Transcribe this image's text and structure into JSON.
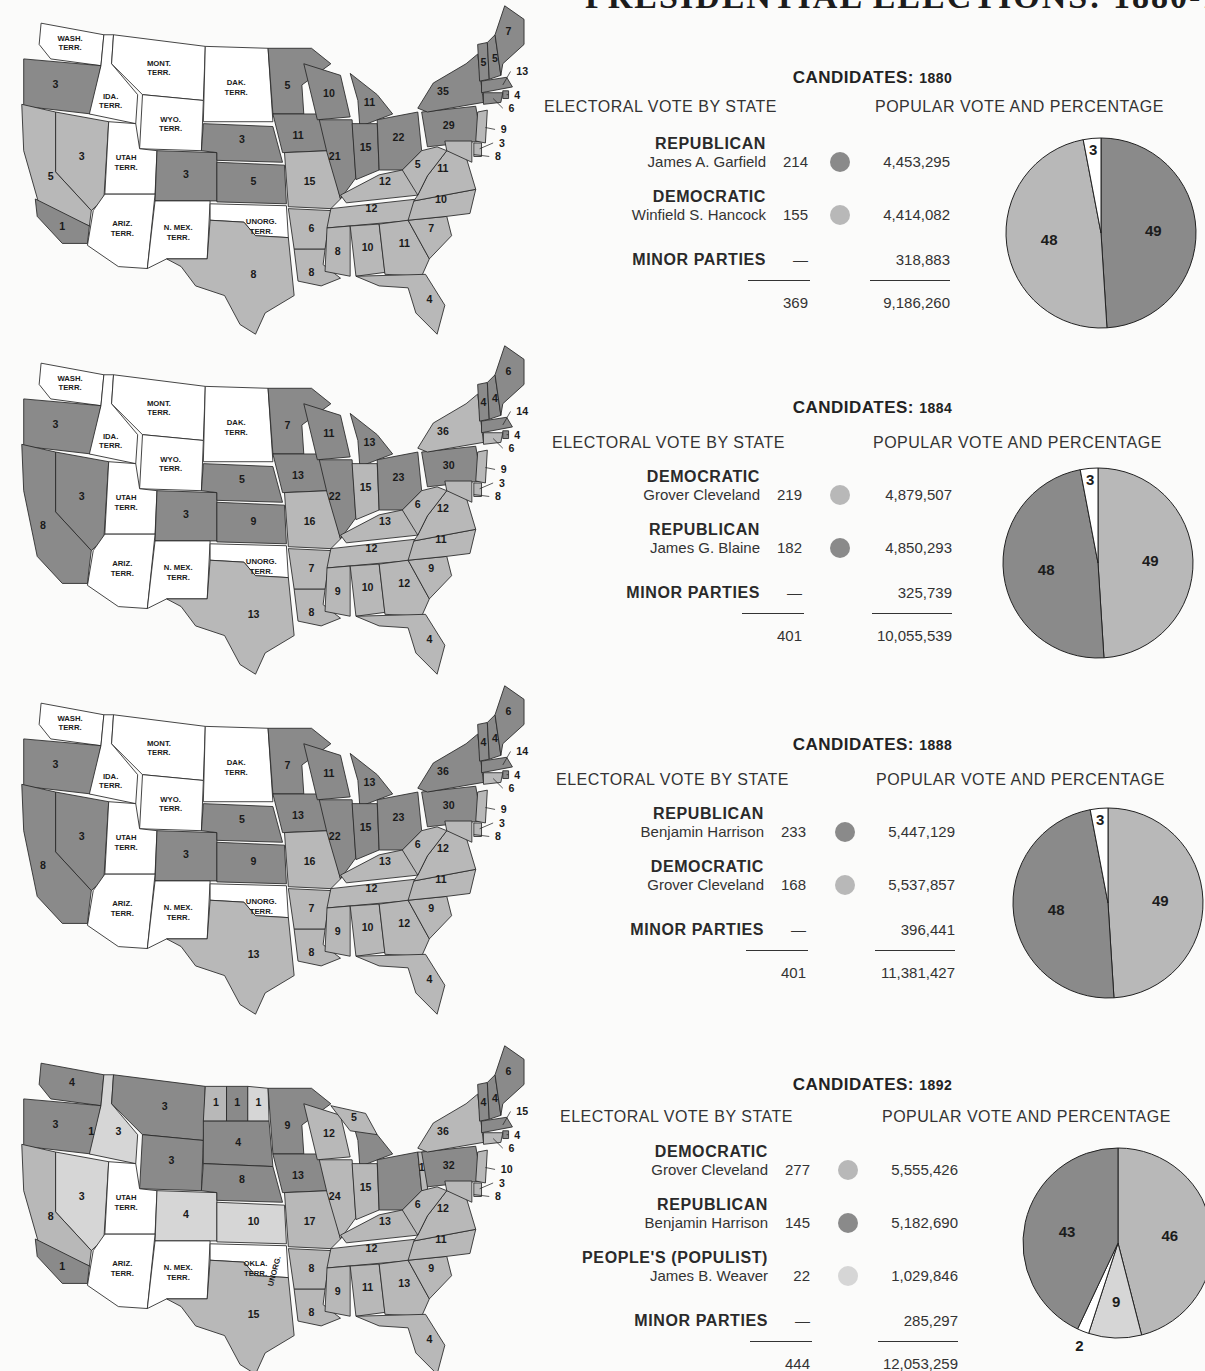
{
  "page": {
    "title": "PRESIDENTIAL ELECTIONS: 1880-1892"
  },
  "colors": {
    "republican": "#8a8a8a",
    "democratic": "#b8b8b8",
    "populist": "#d6d6d6",
    "minor": "#ffffff",
    "territory": "#ffffff",
    "outline": "#2a2a2a"
  },
  "common": {
    "electoral_heading": "ELECTORAL VOTE BY STATE",
    "popular_heading": "POPULAR VOTE AND PERCENTAGE",
    "candidates_label": "CANDIDATES:",
    "dash": "—"
  },
  "elections": [
    {
      "year": "1880",
      "rows": [
        {
          "party": "REPUBLICAN",
          "candidate": "James A. Garfield",
          "electoral": "214",
          "popular": "4,453,295",
          "color": "#8a8a8a"
        },
        {
          "party": "DEMOCRATIC",
          "candidate": "Winfield S. Hancock",
          "electoral": "155",
          "popular": "4,414,082",
          "color": "#b8b8b8"
        },
        {
          "party": "MINOR PARTIES",
          "candidate": "",
          "electoral": "—",
          "popular": "318,883",
          "color": ""
        }
      ],
      "total_electoral": "369",
      "total_popular": "9,186,260",
      "map_labels": {
        "territories": [
          "WASH. TERR.",
          "MONT. TERR.",
          "DAK. TERR.",
          "IDA. TERR.",
          "WYO. TERR.",
          "UTAH TERR.",
          "ARIZ. TERR.",
          "N. MEX. TERR.",
          "UNORG. TERR."
        ],
        "states": {
          "OR": "3",
          "NV": "3",
          "CA_N": "5",
          "CA_S": "1",
          "CO": "3",
          "NE": "3",
          "KS": "5",
          "TX": "8",
          "MN": "5",
          "IA": "11",
          "WI": "10",
          "MI": "11",
          "IL": "21",
          "IN": "15",
          "OH": "22",
          "PA": "29",
          "NY": "35",
          "VT": "5",
          "NH": "5",
          "ME": "7",
          "MA": "13",
          "RI": "4",
          "CT": "6",
          "NJ": "9",
          "DE": "3",
          "MD": "8",
          "MO": "15",
          "KY": "12",
          "WV": "5",
          "VA": "11",
          "TN": "12",
          "NC": "10",
          "SC": "7",
          "AR": "6",
          "LA": "8",
          "MS": "8",
          "AL": "10",
          "GA": "11",
          "FL": "4"
        }
      }
    },
    {
      "year": "1884",
      "rows": [
        {
          "party": "DEMOCRATIC",
          "candidate": "Grover Cleveland",
          "electoral": "219",
          "popular": "4,879,507",
          "color": "#b8b8b8"
        },
        {
          "party": "REPUBLICAN",
          "candidate": "James G. Blaine",
          "electoral": "182",
          "popular": "4,850,293",
          "color": "#8a8a8a"
        },
        {
          "party": "MINOR PARTIES",
          "candidate": "",
          "electoral": "—",
          "popular": "325,739",
          "color": ""
        }
      ],
      "total_electoral": "401",
      "total_popular": "10,055,539",
      "map_labels": {
        "territories": [
          "WASH. TERR.",
          "MONT. TERR.",
          "DAK. TERR.",
          "IDA. TERR.",
          "WYO. TERR.",
          "UTAH TERR.",
          "ARIZ. TERR.",
          "N. MEX. TERR.",
          "UNORG. TERR."
        ],
        "states": {
          "OR": "3",
          "NV": "3",
          "CA": "8",
          "CO": "3",
          "NE": "5",
          "KS": "9",
          "TX": "13",
          "MN": "7",
          "IA": "13",
          "WI": "11",
          "MI": "13",
          "IL": "22",
          "IN": "15",
          "OH": "23",
          "PA": "30",
          "NY": "36",
          "VT": "4",
          "NH": "4",
          "ME": "6",
          "MA": "14",
          "RI": "4",
          "CT": "6",
          "NJ": "9",
          "DE": "3",
          "MD": "8",
          "MO": "16",
          "KY": "13",
          "WV": "6",
          "VA": "12",
          "TN": "12",
          "NC": "11",
          "SC": "9",
          "AR": "7",
          "LA": "8",
          "MS": "9",
          "AL": "10",
          "GA": "12",
          "FL": "4"
        }
      }
    },
    {
      "year": "1888",
      "rows": [
        {
          "party": "REPUBLICAN",
          "candidate": "Benjamin Harrison",
          "electoral": "233",
          "popular": "5,447,129",
          "color": "#8a8a8a"
        },
        {
          "party": "DEMOCRATIC",
          "candidate": "Grover Cleveland",
          "electoral": "168",
          "popular": "5,537,857",
          "color": "#b8b8b8"
        },
        {
          "party": "MINOR PARTIES",
          "candidate": "",
          "electoral": "—",
          "popular": "396,441",
          "color": ""
        }
      ],
      "total_electoral": "401",
      "total_popular": "11,381,427",
      "map_labels": {
        "territories": [
          "WASH. TERR.",
          "MONT. TERR.",
          "DAK. TERR.",
          "IDA. TERR.",
          "WYO. TERR.",
          "UTAH TERR.",
          "ARIZ. TERR.",
          "N. MEX. TERR.",
          "UNORG. TERR."
        ],
        "states": {
          "OR": "3",
          "NV": "3",
          "CA": "8",
          "CO": "3",
          "NE": "5",
          "KS": "9",
          "TX": "13",
          "MN": "7",
          "IA": "13",
          "WI": "11",
          "MI": "13",
          "IL": "22",
          "IN": "15",
          "OH": "23",
          "PA": "30",
          "NY": "36",
          "VT": "4",
          "NH": "4",
          "ME": "6",
          "MA": "14",
          "RI": "4",
          "CT": "6",
          "NJ": "9",
          "DE": "3",
          "MD": "8",
          "MO": "16",
          "KY": "13",
          "WV": "6",
          "VA": "12",
          "TN": "12",
          "NC": "11",
          "SC": "9",
          "AR": "7",
          "LA": "8",
          "MS": "9",
          "AL": "10",
          "GA": "12",
          "FL": "4"
        }
      }
    },
    {
      "year": "1892",
      "rows": [
        {
          "party": "DEMOCRATIC",
          "candidate": "Grover Cleveland",
          "electoral": "277",
          "popular": "5,555,426",
          "color": "#b8b8b8"
        },
        {
          "party": "REPUBLICAN",
          "candidate": "Benjamin Harrison",
          "electoral": "145",
          "popular": "5,182,690",
          "color": "#8a8a8a"
        },
        {
          "party": "PEOPLE'S (POPULIST)",
          "candidate": "James B. Weaver",
          "electoral": "22",
          "popular": "1,029,846",
          "color": "#d6d6d6"
        },
        {
          "party": "MINOR PARTIES",
          "candidate": "",
          "electoral": "—",
          "popular": "285,297",
          "color": ""
        }
      ],
      "total_electoral": "444",
      "total_popular": "12,053,259",
      "map_labels": {
        "territories": [
          "UTAH TERR.",
          "ARIZ. TERR.",
          "N. MEX. TERR.",
          "OKLA. TERR.",
          "UNORG."
        ],
        "states": {
          "WA": "4",
          "OR": "3",
          "OR_split": "1",
          "ID": "3",
          "MT": "3",
          "WY": "3",
          "NV": "3",
          "CA_N": "8",
          "CA_S": "1",
          "CO": "4",
          "ND_a": "1",
          "ND_b": "1",
          "ND_c": "1",
          "SD": "4",
          "NE": "8",
          "KS": "10",
          "TX": "15",
          "MN": "9",
          "IA": "13",
          "WI": "12",
          "MI_a": "5",
          "MI_b": "9",
          "IL": "24",
          "IN": "15",
          "OH_a": "22",
          "OH_b": "1",
          "PA": "32",
          "NY": "36",
          "VT": "4",
          "NH": "4",
          "ME": "6",
          "MA": "15",
          "RI": "4",
          "CT": "6",
          "NJ": "10",
          "DE": "3",
          "MD": "8",
          "MO": "17",
          "KY": "13",
          "WV": "6",
          "VA": "12",
          "TN": "12",
          "NC": "11",
          "SC": "9",
          "AR": "8",
          "LA": "8",
          "MS": "9",
          "AL": "11",
          "GA": "13",
          "FL": "4"
        }
      }
    }
  ],
  "chart_data": [
    {
      "type": "pie",
      "title": "CANDIDATES: 1880 — Popular vote percentage",
      "categories": [
        "Republican (Garfield)",
        "Democratic (Hancock)",
        "Minor parties"
      ],
      "values": [
        49,
        48,
        3
      ],
      "labels": [
        "49",
        "48",
        "3"
      ],
      "colors": [
        "#8a8a8a",
        "#b8b8b8",
        "#ffffff"
      ]
    },
    {
      "type": "pie",
      "title": "CANDIDATES: 1884 — Popular vote percentage",
      "categories": [
        "Democratic (Cleveland)",
        "Republican (Blaine)",
        "Minor parties"
      ],
      "values": [
        49,
        48,
        3
      ],
      "labels": [
        "49",
        "48",
        "3"
      ],
      "colors": [
        "#b8b8b8",
        "#8a8a8a",
        "#ffffff"
      ]
    },
    {
      "type": "pie",
      "title": "CANDIDATES: 1888 — Popular vote percentage",
      "categories": [
        "Democratic (Cleveland)",
        "Republican (Harrison)",
        "Minor parties"
      ],
      "values": [
        49,
        48,
        3
      ],
      "labels": [
        "49",
        "48",
        "3"
      ],
      "colors": [
        "#b8b8b8",
        "#8a8a8a",
        "#ffffff"
      ]
    },
    {
      "type": "pie",
      "title": "CANDIDATES: 1892 — Popular vote percentage",
      "categories": [
        "Democratic (Cleveland)",
        "Populist (Weaver)",
        "Minor parties",
        "Republican (Harrison)"
      ],
      "values": [
        46,
        9,
        2,
        43
      ],
      "labels": [
        "46",
        "9",
        "2",
        "43"
      ],
      "colors": [
        "#b8b8b8",
        "#d6d6d6",
        "#ffffff",
        "#8a8a8a"
      ]
    }
  ]
}
